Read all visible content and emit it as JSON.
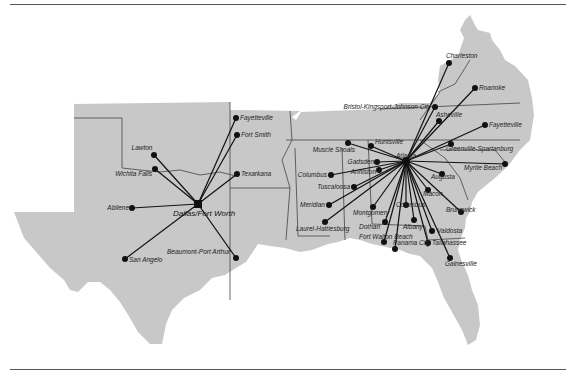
{
  "map": {
    "title": "Route map: Dallas/Fort Worth and Atlanta hubs",
    "colors": {
      "land": "#c8c8c8",
      "route": "#111111",
      "border": "#444444",
      "background": "#ffffff"
    },
    "hubs": [
      {
        "name": "Dallas/Fort Worth",
        "x": 198,
        "y": 204
      },
      {
        "name": "Atlanta",
        "x": 406,
        "y": 161
      }
    ],
    "cities": [
      {
        "name": "Lawton",
        "x": 154,
        "y": 155,
        "hub": 0,
        "lx": 142,
        "ly": 150,
        "anchor": "middle"
      },
      {
        "name": "Wichita Falls",
        "x": 155,
        "y": 169,
        "hub": 0,
        "lx": 152,
        "ly": 176,
        "anchor": "end"
      },
      {
        "name": "Abilene",
        "x": 132,
        "y": 208,
        "hub": 0,
        "lx": 129,
        "ly": 210,
        "anchor": "end"
      },
      {
        "name": "San Angelo",
        "x": 125,
        "y": 259,
        "hub": 0,
        "lx": 129,
        "ly": 262,
        "anchor": "start"
      },
      {
        "name": "Beaumont-Port Arthur",
        "x": 236,
        "y": 258,
        "hub": 0,
        "lx": 230,
        "ly": 254,
        "anchor": "end"
      },
      {
        "name": "Texarkana",
        "x": 237,
        "y": 174,
        "hub": 0,
        "lx": 241,
        "ly": 176,
        "anchor": "start"
      },
      {
        "name": "Fort Smith",
        "x": 237,
        "y": 135,
        "hub": 0,
        "lx": 241,
        "ly": 137,
        "anchor": "start"
      },
      {
        "name": "Fayetteville",
        "x": 236,
        "y": 118,
        "hub": 0,
        "lx": 240,
        "ly": 120,
        "anchor": "start"
      },
      {
        "name": "Charleston",
        "x": 449,
        "y": 63,
        "hub": 1,
        "lx": 446,
        "ly": 58,
        "anchor": "start"
      },
      {
        "name": "Roanoke",
        "x": 475,
        "y": 88,
        "hub": 1,
        "lx": 479,
        "ly": 90,
        "anchor": "start"
      },
      {
        "name": "Bristol-Kingsport-Johnson City",
        "x": 435,
        "y": 107,
        "hub": 1,
        "lx": 431,
        "ly": 109,
        "anchor": "end"
      },
      {
        "name": "Asheville",
        "x": 439,
        "y": 121,
        "hub": 1,
        "lx": 436,
        "ly": 117,
        "anchor": "start"
      },
      {
        "name": "Fayetteville",
        "x": 485,
        "y": 125,
        "hub": 1,
        "lx": 489,
        "ly": 127,
        "anchor": "start"
      },
      {
        "name": "Greenville-Spartanburg",
        "x": 451,
        "y": 144,
        "hub": 1,
        "lx": 446,
        "ly": 151,
        "anchor": "start"
      },
      {
        "name": "Myrtle Beach",
        "x": 505,
        "y": 164,
        "hub": 1,
        "lx": 502,
        "ly": 170,
        "anchor": "end"
      },
      {
        "name": "Augusta",
        "x": 442,
        "y": 174,
        "hub": 1,
        "lx": 431,
        "ly": 179,
        "anchor": "start"
      },
      {
        "name": "Macon",
        "x": 428,
        "y": 190,
        "hub": 1,
        "lx": 423,
        "ly": 196,
        "anchor": "start"
      },
      {
        "name": "Brunswick",
        "x": 461,
        "y": 212,
        "hub": 1,
        "lx": 446,
        "ly": 212,
        "anchor": "start"
      },
      {
        "name": "Valdosta",
        "x": 432,
        "y": 231,
        "hub": 1,
        "lx": 437,
        "ly": 233,
        "anchor": "start"
      },
      {
        "name": "Tallahassee",
        "x": 428,
        "y": 243,
        "hub": 1,
        "lx": 432,
        "ly": 245,
        "anchor": "start"
      },
      {
        "name": "Gainesville",
        "x": 450,
        "y": 258,
        "hub": 1,
        "lx": 445,
        "ly": 266,
        "anchor": "start"
      },
      {
        "name": "Albany",
        "x": 414,
        "y": 220,
        "hub": 1,
        "lx": 403,
        "ly": 229,
        "anchor": "start"
      },
      {
        "name": "Columbus",
        "x": 406,
        "y": 205,
        "hub": 1,
        "lx": 396,
        "ly": 207,
        "anchor": "start"
      },
      {
        "name": "Panama City",
        "x": 395,
        "y": 249,
        "hub": 1,
        "lx": 393,
        "ly": 245,
        "anchor": "start"
      },
      {
        "name": "Fort Walton Beach",
        "x": 384,
        "y": 242,
        "hub": 1,
        "lx": 359,
        "ly": 239,
        "anchor": "start"
      },
      {
        "name": "Dothan",
        "x": 385,
        "y": 222,
        "hub": 1,
        "lx": 380,
        "ly": 229,
        "anchor": "end"
      },
      {
        "name": "Montgomery",
        "x": 373,
        "y": 207,
        "hub": 1,
        "lx": 353,
        "ly": 215,
        "anchor": "start"
      },
      {
        "name": "Gadsden",
        "x": 377,
        "y": 162,
        "hub": 1,
        "lx": 374,
        "ly": 164,
        "anchor": "end"
      },
      {
        "name": "Anniston",
        "x": 379,
        "y": 170,
        "hub": 1,
        "lx": 376,
        "ly": 174,
        "anchor": "end"
      },
      {
        "name": "Huntsville",
        "x": 371,
        "y": 146,
        "hub": 1,
        "lx": 375,
        "ly": 144,
        "anchor": "start"
      },
      {
        "name": "Muscle Shoals",
        "x": 348,
        "y": 143,
        "hub": 1,
        "lx": 355,
        "ly": 152,
        "anchor": "end"
      },
      {
        "name": "Columbus",
        "x": 331,
        "y": 175,
        "hub": 1,
        "lx": 327,
        "ly": 177,
        "anchor": "end"
      },
      {
        "name": "Tuscaloosa",
        "x": 354,
        "y": 187,
        "hub": 1,
        "lx": 350,
        "ly": 189,
        "anchor": "end"
      },
      {
        "name": "Meridian",
        "x": 329,
        "y": 205,
        "hub": 1,
        "lx": 325,
        "ly": 207,
        "anchor": "end"
      },
      {
        "name": "Laurel-Hattiesburg",
        "x": 325,
        "y": 222,
        "hub": 1,
        "lx": 296,
        "ly": 231,
        "anchor": "start"
      }
    ]
  }
}
